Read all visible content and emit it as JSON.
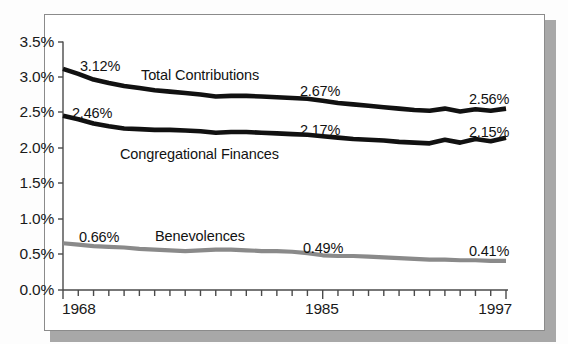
{
  "figure": {
    "frame_border_color": "#8b8b8b",
    "shadow_color": "#a8a8a8",
    "background": "#ffffff"
  },
  "chart_data": {
    "type": "line",
    "title": "",
    "subtitle": "",
    "xlabel": "",
    "ylabel": "",
    "grid": false,
    "legend_position": "inline-annotations",
    "xlim": [
      1968,
      1997
    ],
    "ylim": [
      0.0,
      3.5
    ],
    "x": [
      1968,
      1969,
      1970,
      1971,
      1972,
      1973,
      1974,
      1975,
      1976,
      1977,
      1978,
      1979,
      1980,
      1981,
      1982,
      1983,
      1984,
      1985,
      1986,
      1987,
      1988,
      1989,
      1990,
      1991,
      1992,
      1993,
      1994,
      1995,
      1996,
      1997
    ],
    "ytick_labels": [
      "0.0%",
      "0.5%",
      "1.0%",
      "1.5%",
      "2.0%",
      "2.5%",
      "3.0%",
      "3.5%"
    ],
    "ytick_values": [
      0.0,
      0.5,
      1.0,
      1.5,
      2.0,
      2.5,
      3.0,
      3.5
    ],
    "xtick_labels_shown": [
      "1968",
      "1985",
      "1997"
    ],
    "xtick_label_years": [
      1968,
      1985,
      1997
    ],
    "xtick_count": 30,
    "series": [
      {
        "name": "Total Contributions",
        "color": "#111111",
        "width": 4.6,
        "values": [
          3.12,
          3.05,
          2.97,
          2.92,
          2.88,
          2.85,
          2.82,
          2.8,
          2.78,
          2.76,
          2.73,
          2.74,
          2.74,
          2.73,
          2.72,
          2.71,
          2.7,
          2.67,
          2.64,
          2.62,
          2.6,
          2.58,
          2.56,
          2.54,
          2.53,
          2.56,
          2.52,
          2.55,
          2.53,
          2.56
        ]
      },
      {
        "name": "Congregational Finances",
        "color": "#111111",
        "width": 4.6,
        "values": [
          2.46,
          2.41,
          2.35,
          2.31,
          2.28,
          2.27,
          2.26,
          2.26,
          2.25,
          2.24,
          2.22,
          2.23,
          2.23,
          2.22,
          2.21,
          2.2,
          2.19,
          2.17,
          2.15,
          2.13,
          2.12,
          2.11,
          2.09,
          2.08,
          2.07,
          2.12,
          2.08,
          2.13,
          2.1,
          2.15
        ]
      },
      {
        "name": "Benevolences",
        "color": "#8a8a8a",
        "width": 4.2,
        "values": [
          0.66,
          0.64,
          0.62,
          0.61,
          0.6,
          0.58,
          0.57,
          0.56,
          0.55,
          0.56,
          0.57,
          0.57,
          0.56,
          0.55,
          0.55,
          0.54,
          0.52,
          0.49,
          0.48,
          0.48,
          0.47,
          0.46,
          0.45,
          0.44,
          0.43,
          0.43,
          0.42,
          0.42,
          0.41,
          0.41
        ]
      }
    ],
    "annotations": [
      {
        "text": "3.12%",
        "series": "Total Contributions",
        "year": 1968,
        "x": 80,
        "y": 58
      },
      {
        "text": "2.67%",
        "series": "Total Contributions",
        "year": 1985,
        "x": 300,
        "y": 83
      },
      {
        "text": "2.56%",
        "series": "Total Contributions",
        "year": 1997,
        "x": 469,
        "y": 91
      },
      {
        "text": "2.46%",
        "series": "Congregational Finances",
        "year": 1968,
        "x": 72,
        "y": 105
      },
      {
        "text": "2.17%",
        "series": "Congregational Finances",
        "year": 1985,
        "x": 300,
        "y": 122
      },
      {
        "text": "2.15%",
        "series": "Congregational Finances",
        "year": 1997,
        "x": 469,
        "y": 124
      },
      {
        "text": "0.66%",
        "series": "Benevolences",
        "year": 1968,
        "x": 79,
        "y": 229
      },
      {
        "text": "0.49%",
        "series": "Benevolences",
        "year": 1985,
        "x": 303,
        "y": 240
      },
      {
        "text": "0.41%",
        "series": "Benevolences",
        "year": 1997,
        "x": 469,
        "y": 243
      },
      {
        "text": "Total Contributions",
        "series": "Total Contributions",
        "x": 141,
        "y": 67
      },
      {
        "text": "Congregational Finances",
        "series": "Congregational Finances",
        "x": 120,
        "y": 146
      },
      {
        "text": "Benevolences",
        "series": "Benevolences",
        "x": 155,
        "y": 228
      }
    ]
  },
  "axes": {
    "y_ticks": [
      {
        "label": "3.5%",
        "value": 3.5,
        "px_y": 42
      },
      {
        "label": "3.0%",
        "value": 3.0,
        "px_y": 77
      },
      {
        "label": "2.5%",
        "value": 2.5,
        "px_y": 112
      },
      {
        "label": "2.0%",
        "value": 2.0,
        "px_y": 148
      },
      {
        "label": "1.5%",
        "value": 1.5,
        "px_y": 183
      },
      {
        "label": "1.0%",
        "value": 1.0,
        "px_y": 219
      },
      {
        "label": "0.5%",
        "value": 0.5,
        "px_y": 254
      },
      {
        "label": "0.0%",
        "value": 0.0,
        "px_y": 290
      }
    ],
    "x_ticks": [
      {
        "label": "1968",
        "px_x": 63
      },
      {
        "label": "1985",
        "px_x": 323
      },
      {
        "label": "1997",
        "px_x": 506
      }
    ]
  }
}
